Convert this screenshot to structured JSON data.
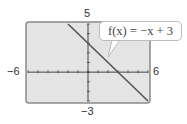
{
  "chart_data": {
    "type": "line",
    "title": "",
    "xlabel": "",
    "ylabel": "",
    "xlim": [
      -6,
      6
    ],
    "ylim": [
      -3,
      5
    ],
    "xscl": 1,
    "yscl": 1,
    "grid": false,
    "series": [
      {
        "name": "f(x) = −x + 3",
        "function": "-x+3",
        "x": [
          -2,
          6
        ],
        "y": [
          5,
          -3
        ]
      }
    ],
    "annotations": [
      {
        "text": "f(x) = −x + 3",
        "points_to": [
          2.5,
          0.5
        ]
      }
    ],
    "window_labels": {
      "xmin": "−6",
      "xmax": "6",
      "ymin": "−3",
      "ymax": "5"
    }
  },
  "colors": {
    "plot_background": "#e4e4e4",
    "frame": "#8a8a8a",
    "line": "#555555",
    "axes": "#444444"
  }
}
